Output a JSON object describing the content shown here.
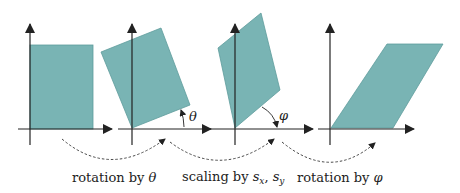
{
  "figure": {
    "colors": {
      "shape_fill": "#79b4b4",
      "shape_stroke": "#5e9c9c",
      "axis": "#222222",
      "arrow_dashed": "#333333"
    },
    "angles": {
      "theta": "θ",
      "phi": "φ"
    },
    "captions": [
      {
        "prefix": "rotation by ",
        "symbol": "θ",
        "sub": ""
      },
      {
        "prefix": "scaling by ",
        "symbol": "s",
        "sub1": "x",
        "sep": ", ",
        "symbol2": "s",
        "sub2": "y"
      },
      {
        "prefix": "rotation by ",
        "symbol": "φ",
        "sub": ""
      }
    ]
  }
}
